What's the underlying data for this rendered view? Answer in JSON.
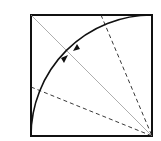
{
  "diagram": {
    "square": {
      "x": 31,
      "y": 15,
      "size": 121,
      "stroke": "#111111"
    },
    "diagonal": {
      "from": [
        31,
        15
      ],
      "to": [
        152,
        136
      ],
      "stroke": "#999999"
    },
    "arc": {
      "center": [
        152,
        136
      ],
      "radius": 121,
      "stroke": "#111111"
    },
    "dashed_lines": [
      {
        "from": [
          31,
          87
        ],
        "to": [
          152,
          136
        ]
      },
      {
        "from": [
          101,
          15
        ],
        "to": [
          152,
          136
        ]
      }
    ],
    "arrows": [
      {
        "position": "lower",
        "direction": "toward-intersection"
      },
      {
        "position": "upper",
        "direction": "toward-intersection"
      }
    ]
  }
}
